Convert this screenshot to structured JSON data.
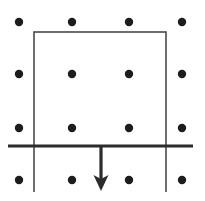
{
  "figure": {
    "canvas": {
      "width": 205,
      "height": 201,
      "background": "#ffffff"
    },
    "colors": {
      "dot": "#1d1d1d",
      "thin_line": "#4a4a4a",
      "thick_line": "#2b2b2b",
      "arrow": "#2b2b2b"
    },
    "lattice": {
      "label": "dot-grid",
      "rows": 4,
      "cols": 4,
      "x_positions": [
        19,
        72,
        129,
        182
      ],
      "y_positions": [
        22,
        74,
        128,
        180
      ],
      "dot_radius": 4.2,
      "dot_count": 16
    },
    "rectangle": {
      "label": "rectangle-outline",
      "x": 34,
      "y": 32,
      "width": 132,
      "height": 114,
      "stroke_width": 1.6,
      "fill": "none"
    },
    "vertical_extensions": {
      "label": "rectangle-sides-extended-below",
      "left_x": 34,
      "right_x": 166,
      "from_y": 146,
      "to_y": 192,
      "stroke_width": 1.6
    },
    "horizontal_line": {
      "label": "mirror-line",
      "x1": 8,
      "x2": 193,
      "y": 146,
      "stroke_width": 3.2
    },
    "arrow": {
      "label": "translation-vector-down",
      "x": 101,
      "y_start": 146,
      "y_end": 191,
      "direction": "down",
      "shaft_width": 3.2,
      "head_width": 15,
      "head_length": 16
    }
  }
}
